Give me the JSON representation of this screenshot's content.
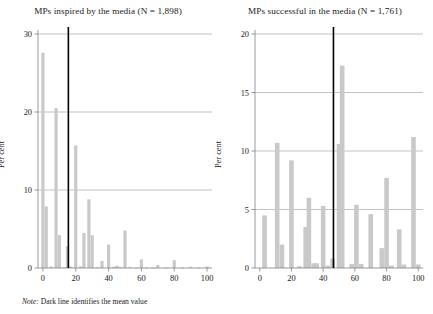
{
  "figure": {
    "note_prefix": "Note:",
    "note_text": " Dark line identifies the mean value",
    "bar_color": "#c9c9c9",
    "mean_line_color": "#000000",
    "axis_color": "#808080",
    "grid_color": "#9a9a9a"
  },
  "panels": [
    {
      "id": "left",
      "title": "MPs inspired by the media (N = 1,898)",
      "ylabel": "Per cent"
    },
    {
      "id": "right",
      "title": "MPs successful in the media (N = 1,761)",
      "ylabel": "Per cent"
    }
  ],
  "chart_data": [
    {
      "type": "bar",
      "title": "MPs inspired by the media (N = 1,898)",
      "xlabel": "",
      "ylabel": "Per cent",
      "xlim": [
        -3,
        103
      ],
      "ylim": [
        0,
        30
      ],
      "xticks": [
        0,
        20,
        40,
        60,
        80,
        100
      ],
      "yticks": [
        0,
        10,
        20,
        30
      ],
      "grid": "horizontal",
      "legend": "none",
      "mean_line_x": 15.5,
      "x": [
        0,
        2,
        5,
        8,
        10,
        13,
        15,
        17,
        20,
        23,
        25,
        28,
        30,
        33,
        36,
        40,
        43,
        45,
        47,
        50,
        53,
        57,
        60,
        63,
        67,
        70,
        75,
        80,
        85,
        90,
        95,
        100
      ],
      "values": [
        27.6,
        7.9,
        0.2,
        20.5,
        4.2,
        0.1,
        2.8,
        0.2,
        15.7,
        0.2,
        4.5,
        8.8,
        4.2,
        0.1,
        0.9,
        3.0,
        0.15,
        0.3,
        0.15,
        4.8,
        0.1,
        0.05,
        1.1,
        0.05,
        0.05,
        0.4,
        0.05,
        1.0,
        0.05,
        0.15,
        0.05,
        0.2
      ],
      "bars": [
        {
          "x": 0,
          "value": 27.6
        },
        {
          "x": 2,
          "value": 7.9
        },
        {
          "x": 5,
          "value": 0.2
        },
        {
          "x": 8,
          "value": 20.5
        },
        {
          "x": 10,
          "value": 4.2
        },
        {
          "x": 13,
          "value": 0.1
        },
        {
          "x": 15,
          "value": 2.8
        },
        {
          "x": 17,
          "value": 0.2
        },
        {
          "x": 20,
          "value": 15.7
        },
        {
          "x": 23,
          "value": 0.2
        },
        {
          "x": 25,
          "value": 4.5
        },
        {
          "x": 28,
          "value": 8.8
        },
        {
          "x": 30,
          "value": 4.2
        },
        {
          "x": 33,
          "value": 0.1
        },
        {
          "x": 36,
          "value": 0.9
        },
        {
          "x": 40,
          "value": 3.0
        },
        {
          "x": 43,
          "value": 0.15
        },
        {
          "x": 45,
          "value": 0.3
        },
        {
          "x": 47,
          "value": 0.15
        },
        {
          "x": 50,
          "value": 4.8
        },
        {
          "x": 53,
          "value": 0.1
        },
        {
          "x": 57,
          "value": 0.05
        },
        {
          "x": 60,
          "value": 1.1
        },
        {
          "x": 63,
          "value": 0.05
        },
        {
          "x": 67,
          "value": 0.05
        },
        {
          "x": 70,
          "value": 0.4
        },
        {
          "x": 75,
          "value": 0.05
        },
        {
          "x": 80,
          "value": 1.0
        },
        {
          "x": 85,
          "value": 0.05
        },
        {
          "x": 90,
          "value": 0.15
        },
        {
          "x": 95,
          "value": 0.05
        },
        {
          "x": 100,
          "value": 0.2
        }
      ]
    },
    {
      "type": "bar",
      "title": "MPs successful in the media (N = 1,761)",
      "xlabel": "",
      "ylabel": "Per cent",
      "xlim": [
        -3,
        103
      ],
      "ylim": [
        0,
        20
      ],
      "xticks": [
        0,
        20,
        40,
        60,
        80,
        100
      ],
      "yticks": [
        0,
        5,
        10,
        15,
        20
      ],
      "grid": "horizontal",
      "legend": "none",
      "mean_line_x": 46.5,
      "x": [
        3,
        11,
        14,
        20,
        25,
        29,
        31,
        34,
        36,
        40,
        43,
        46,
        50,
        52,
        58,
        61,
        64,
        70,
        77,
        80,
        83,
        88,
        91,
        97,
        100
      ],
      "values": [
        4.5,
        10.7,
        2.0,
        9.2,
        0.15,
        3.5,
        6.0,
        0.4,
        0.4,
        5.3,
        0.2,
        0.8,
        10.6,
        17.3,
        0.35,
        5.4,
        0.35,
        4.6,
        1.7,
        7.7,
        0.2,
        3.3,
        0.3,
        11.2,
        0.3
      ],
      "bars": [
        {
          "x": 3,
          "value": 4.5
        },
        {
          "x": 11,
          "value": 10.7
        },
        {
          "x": 14,
          "value": 2.0
        },
        {
          "x": 20,
          "value": 9.2
        },
        {
          "x": 25,
          "value": 0.15
        },
        {
          "x": 29,
          "value": 3.5
        },
        {
          "x": 31,
          "value": 6.0
        },
        {
          "x": 34,
          "value": 0.4
        },
        {
          "x": 36,
          "value": 0.4
        },
        {
          "x": 40,
          "value": 5.3
        },
        {
          "x": 43,
          "value": 0.2
        },
        {
          "x": 46,
          "value": 0.8
        },
        {
          "x": 50,
          "value": 10.6
        },
        {
          "x": 52,
          "value": 17.3
        },
        {
          "x": 58,
          "value": 0.35
        },
        {
          "x": 61,
          "value": 5.4
        },
        {
          "x": 64,
          "value": 0.35
        },
        {
          "x": 70,
          "value": 4.6
        },
        {
          "x": 77,
          "value": 1.7
        },
        {
          "x": 80,
          "value": 7.7
        },
        {
          "x": 83,
          "value": 0.2
        },
        {
          "x": 88,
          "value": 3.3
        },
        {
          "x": 91,
          "value": 0.3
        },
        {
          "x": 97,
          "value": 11.2
        },
        {
          "x": 100,
          "value": 0.3
        }
      ]
    }
  ]
}
